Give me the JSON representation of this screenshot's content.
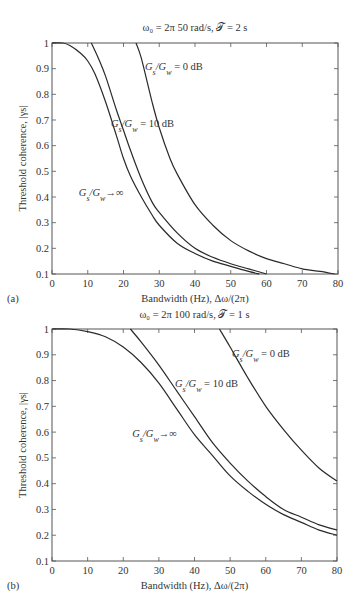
{
  "chart_data": [
    {
      "type": "line",
      "panel_label": "(a)",
      "title": "ω₀ = 2π 50 rad/s, 𝒯 = 2 s",
      "xlabel": "Bandwidth (Hz), Δω/(2π)",
      "ylabel": "Threshold coherence, |γs|",
      "xlim": [
        0,
        80
      ],
      "ylim": [
        0.1,
        1
      ],
      "xticks": [
        0,
        10,
        20,
        30,
        40,
        50,
        60,
        70,
        80
      ],
      "yticks": [
        0.1,
        0.2,
        0.3,
        0.4,
        0.5,
        0.6,
        0.7,
        0.8,
        0.9,
        1
      ],
      "ytick_labels": [
        "0.1",
        "0.2",
        "0.3",
        "0.4",
        "0.5",
        "0.6",
        "0.7",
        "0.8",
        "0.9",
        "1"
      ],
      "grid": false,
      "series": [
        {
          "name": "Gs/Gw → ∞",
          "x": [
            0,
            3,
            5,
            8,
            10,
            12,
            15,
            18,
            20,
            22,
            25,
            28,
            30,
            35,
            40,
            45,
            50,
            55,
            58
          ],
          "y": [
            1.0,
            1.0,
            0.99,
            0.96,
            0.93,
            0.88,
            0.77,
            0.64,
            0.55,
            0.48,
            0.4,
            0.33,
            0.29,
            0.22,
            0.18,
            0.15,
            0.13,
            0.11,
            0.1
          ]
        },
        {
          "name": "Gs/Gw = 10 dB",
          "x": [
            11,
            13,
            15,
            18,
            20,
            22,
            25,
            28,
            30,
            35,
            40,
            45,
            50,
            55,
            60
          ],
          "y": [
            1.0,
            0.94,
            0.87,
            0.74,
            0.66,
            0.58,
            0.47,
            0.38,
            0.34,
            0.26,
            0.2,
            0.165,
            0.14,
            0.12,
            0.1
          ]
        },
        {
          "name": "Gs/Gw = 0 dB",
          "x": [
            23.5,
            25,
            28,
            30,
            33,
            35,
            40,
            45,
            50,
            55,
            60,
            65,
            70,
            75,
            79
          ],
          "y": [
            1.0,
            0.94,
            0.77,
            0.67,
            0.55,
            0.49,
            0.37,
            0.29,
            0.23,
            0.19,
            0.16,
            0.14,
            0.12,
            0.11,
            0.1
          ]
        }
      ],
      "annotations": [
        {
          "text_main": "G",
          "sub1": "s",
          "mid": "/G",
          "sub2": "w",
          "tail": " = 0 dB",
          "x": 26,
          "y": 0.91
        },
        {
          "text_main": "G",
          "sub1": "s",
          "mid": "/G",
          "sub2": "w",
          "tail": " = 10 dB",
          "x": 16.5,
          "y": 0.69
        },
        {
          "text_main": "G",
          "sub1": "s",
          "mid": "/G",
          "sub2": "w",
          "tail": "→∞",
          "x": 7.5,
          "y": 0.42
        }
      ]
    },
    {
      "type": "line",
      "panel_label": "(b)",
      "title": "ω₀ = 2π 100 rad/s, 𝒯 = 1 s",
      "xlabel": "Bandwidth (Hz), Δω/(2π)",
      "ylabel": "Threshold coherence, |γs|",
      "xlim": [
        0,
        80
      ],
      "ylim": [
        0.1,
        1
      ],
      "xticks": [
        0,
        10,
        20,
        30,
        40,
        50,
        60,
        70,
        80
      ],
      "yticks": [
        0.1,
        0.2,
        0.3,
        0.4,
        0.5,
        0.6,
        0.7,
        0.8,
        0.9,
        1
      ],
      "ytick_labels": [
        "0.1",
        "0.2",
        "0.3",
        "0.4",
        "0.5",
        "0.6",
        "0.7",
        "0.8",
        "0.9",
        "1"
      ],
      "grid": false,
      "series": [
        {
          "name": "Gs/Gw → ∞",
          "x": [
            0,
            5,
            10,
            15,
            20,
            25,
            30,
            35,
            40,
            45,
            50,
            55,
            60,
            65,
            70,
            75,
            80
          ],
          "y": [
            1.0,
            1.0,
            0.99,
            0.97,
            0.93,
            0.87,
            0.79,
            0.69,
            0.59,
            0.51,
            0.43,
            0.37,
            0.32,
            0.28,
            0.25,
            0.22,
            0.2
          ]
        },
        {
          "name": "Gs/Gw = 10 dB",
          "x": [
            22,
            25,
            30,
            35,
            40,
            45,
            50,
            55,
            60,
            65,
            70,
            75,
            80
          ],
          "y": [
            1.0,
            0.95,
            0.86,
            0.76,
            0.66,
            0.56,
            0.48,
            0.41,
            0.35,
            0.3,
            0.27,
            0.24,
            0.22
          ]
        },
        {
          "name": "Gs/Gw = 0 dB",
          "x": [
            47,
            50,
            55,
            60,
            65,
            70,
            75,
            80
          ],
          "y": [
            1.0,
            0.93,
            0.81,
            0.7,
            0.61,
            0.53,
            0.46,
            0.41
          ]
        }
      ],
      "annotations": [
        {
          "text_main": "G",
          "sub1": "s",
          "mid": "/G",
          "sub2": "w",
          "tail": " = 0 dB",
          "x": 50.5,
          "y": 0.905
        },
        {
          "text_main": "G",
          "sub1": "s",
          "mid": "/G",
          "sub2": "w",
          "tail": " = 10 dB",
          "x": 34.5,
          "y": 0.79
        },
        {
          "text_main": "G",
          "sub1": "s",
          "mid": "/G",
          "sub2": "w",
          "tail": "→∞",
          "x": 22.5,
          "y": 0.595
        }
      ]
    }
  ]
}
